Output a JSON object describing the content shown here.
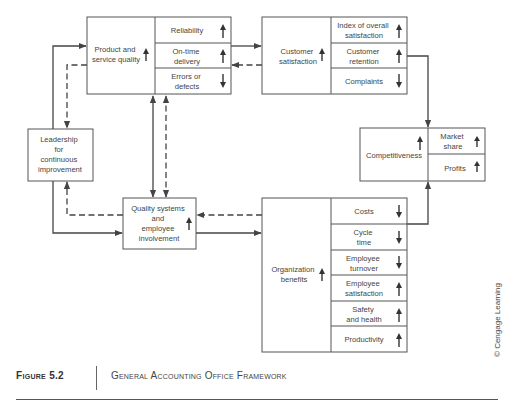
{
  "diagram": {
    "nodes": {
      "product_quality": {
        "label_lines": [
          "Product and",
          "service quality"
        ],
        "trend": "up",
        "metrics": [
          {
            "label_lines": [
              "Reliability"
            ],
            "trend": "up"
          },
          {
            "label_lines": [
              "On-time",
              "delivery"
            ],
            "trend": "up"
          },
          {
            "label_lines": [
              "Errors or",
              "defects"
            ],
            "trend": "down"
          }
        ]
      },
      "customer_satisfaction": {
        "label_lines": [
          "Customer",
          "satisfaction"
        ],
        "trend": "up",
        "metrics": [
          {
            "label_lines": [
              "Index of overall",
              "satisfaction"
            ],
            "trend": "up"
          },
          {
            "label_lines": [
              "Customer",
              "retention"
            ],
            "trend": "up"
          },
          {
            "label_lines": [
              "Complaints"
            ],
            "trend": "down"
          }
        ]
      },
      "competitiveness": {
        "label_lines": [
          "Competitiveness"
        ],
        "trend": "up",
        "metrics": [
          {
            "label_lines": [
              "Market",
              "share"
            ],
            "trend": "up"
          },
          {
            "label_lines": [
              "Profits"
            ],
            "trend": "up"
          }
        ]
      },
      "leadership": {
        "label_lines": [
          "Leadership",
          "for",
          "continuous",
          "improvement"
        ]
      },
      "quality_systems": {
        "label_lines": [
          "Quality systems",
          "and",
          "employee",
          "involvement"
        ],
        "trend": "up"
      },
      "organization_benefits": {
        "label_lines": [
          "Organization",
          "benefits"
        ],
        "trend": "up",
        "metrics": [
          {
            "label_lines": [
              "Costs"
            ],
            "trend": "down"
          },
          {
            "label_lines": [
              "Cycle",
              "time"
            ],
            "trend": "down"
          },
          {
            "label_lines": [
              "Employee",
              "turnover"
            ],
            "trend": "down"
          },
          {
            "label_lines": [
              "Employee",
              "satisfaction"
            ],
            "trend": "up"
          },
          {
            "label_lines": [
              "Safety",
              "and health"
            ],
            "trend": "up"
          },
          {
            "label_lines": [
              "Productivity"
            ],
            "trend": "up"
          }
        ]
      }
    },
    "edges": [
      {
        "from": "leadership",
        "to": "product_quality",
        "style": "solid"
      },
      {
        "from": "product_quality",
        "to": "leadership",
        "style": "dashed"
      },
      {
        "from": "product_quality",
        "to": "customer_satisfaction",
        "style": "solid"
      },
      {
        "from": "customer_satisfaction",
        "to": "product_quality",
        "style": "dashed"
      },
      {
        "from": "customer_satisfaction",
        "to": "competitiveness",
        "style": "solid"
      },
      {
        "from": "product_quality",
        "to": "quality_systems",
        "style": "solid",
        "bidirectional": true
      },
      {
        "from": "quality_systems",
        "to": "product_quality",
        "style": "dashed",
        "bidirectional": true
      },
      {
        "from": "leadership",
        "to": "quality_systems",
        "style": "solid"
      },
      {
        "from": "quality_systems",
        "to": "leadership",
        "style": "dashed"
      },
      {
        "from": "quality_systems",
        "to": "organization_benefits",
        "style": "solid"
      },
      {
        "from": "organization_benefits",
        "to": "quality_systems",
        "style": "dashed"
      },
      {
        "from": "organization_benefits",
        "to": "competitiveness",
        "style": "solid"
      }
    ]
  },
  "caption": {
    "figure_label": "Figure 5.2",
    "title": "General Accounting Office Framework"
  },
  "credit": "© Cengage Learning",
  "colors": {
    "line": "#444444",
    "box_border": "#555555",
    "text": "#444444",
    "background": "#ffffff"
  }
}
